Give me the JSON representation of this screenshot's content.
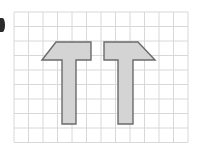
{
  "page": {
    "background_color": "#ffffff",
    "width": 202,
    "height": 152
  },
  "edge_artifact": {
    "name": "page-edge-mark",
    "description": "partial dark glyph cropped at left edge",
    "color": "#2b2b2b",
    "x": 0,
    "y": 18,
    "width": 5,
    "height": 14
  },
  "grid": {
    "line_color": "#d8d8d8",
    "border_color": "#d0d0d0",
    "x_start": 14,
    "y_start": 12,
    "cell_size": 14.5,
    "columns": 12,
    "rows": 9,
    "x_end": 188,
    "y_end": 142
  },
  "shapes": {
    "fill_color": "#d4d4d4",
    "stroke_color": "#6b6b6b",
    "stroke_width": 1.4,
    "count": 2,
    "items": [
      {
        "name": "left-polygon",
        "label": "Shape A",
        "orientation": "diagonal-left",
        "points": "42,60 56,42 91,42 91,60 76,60 76,124 62,124 62,60",
        "vertices": 8
      },
      {
        "name": "right-polygon",
        "label": "Shape B",
        "orientation": "diagonal-right",
        "points": "155,60 138,42 104,42 104,60 118,60 118,124 133,124 133,60",
        "vertices": 8
      }
    ]
  },
  "chart_data": {
    "type": "diagram",
    "xlabel": "",
    "ylabel": "",
    "grid": true,
    "grid_columns": 12,
    "grid_rows": 9,
    "series": [
      {
        "name": "Shape A",
        "values": [
          42,
          60,
          56,
          42,
          91,
          42,
          91,
          60,
          76,
          60,
          76,
          124,
          62,
          124,
          62,
          60
        ]
      },
      {
        "name": "Shape B",
        "values": [
          155,
          60,
          138,
          42,
          104,
          42,
          104,
          60,
          118,
          60,
          118,
          124,
          133,
          124,
          133,
          60
        ]
      }
    ]
  }
}
